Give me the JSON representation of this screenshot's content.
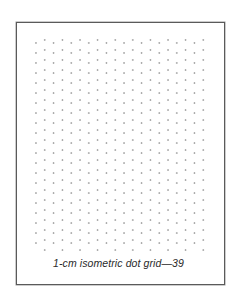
{
  "page": {
    "caption": "1-cm isometric dot grid—39",
    "frame_color": "#5a5a5a",
    "dot_color": "#9a9a9a"
  },
  "dot_grid": {
    "type": "isometric",
    "columns": 20,
    "rows_per_column": 21,
    "origin_x": 36,
    "origin_y": 43,
    "column_spacing": 8.8,
    "row_spacing": 10.0,
    "odd_column_offset_y": -3.0
  }
}
